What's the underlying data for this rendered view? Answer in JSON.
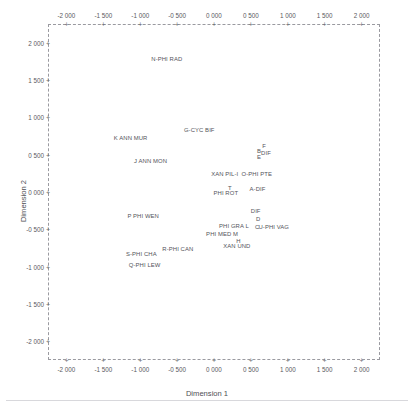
{
  "chart_data": {
    "type": "scatter",
    "title": "",
    "xlabel": "Dimension 1",
    "ylabel": "Dimension 2",
    "xlim": [
      -2.25,
      2.25
    ],
    "ylim": [
      -2.25,
      2.25
    ],
    "grid": false,
    "legend": null,
    "axis_style": "dashed-box-with-plus-ticks",
    "decimal_separator": "space",
    "xticks": [
      -2.0,
      -1.5,
      -1.0,
      -0.5,
      0.0,
      0.5,
      1.0,
      1.5,
      2.0
    ],
    "xticklabels": [
      "-2 000",
      "-1 500",
      "-1 000",
      "-0 500",
      "0 000",
      "0 500",
      "1 000",
      "1 500",
      "2 000"
    ],
    "yticks": [
      2.0,
      1.5,
      1.0,
      0.5,
      0.0,
      -0.5,
      -1.0,
      -1.5,
      -2.0
    ],
    "yticklabels": [
      "2 000",
      "1 500",
      "1 000",
      "0 500",
      "0 000",
      "-0 500",
      "-1 000",
      "-1 500",
      "-2 000"
    ],
    "points": [
      {
        "label": "N-PHI RAD",
        "x": -0.64,
        "y": 1.78,
        "anchor": "center"
      },
      {
        "label": "G-CYC BIF",
        "x": -0.2,
        "y": 0.83,
        "anchor": "center"
      },
      {
        "label": "K  ANN MUR",
        "x": -1.13,
        "y": 0.72,
        "anchor": "center"
      },
      {
        "label": "F",
        "x": 0.68,
        "y": 0.62,
        "anchor": "center"
      },
      {
        "label": "B",
        "x": 0.61,
        "y": 0.545,
        "anchor": "center"
      },
      {
        "label": "DIF",
        "x": 0.705,
        "y": 0.52,
        "anchor": "center"
      },
      {
        "label": "E",
        "x": 0.61,
        "y": 0.47,
        "anchor": "center"
      },
      {
        "label": "J  ANN MON",
        "x": -0.86,
        "y": 0.415,
        "anchor": "center"
      },
      {
        "label": "XAN PIL-I",
        "x": 0.145,
        "y": 0.24,
        "anchor": "center"
      },
      {
        "label": "O-PHI PTE",
        "x": 0.58,
        "y": 0.24,
        "anchor": "center"
      },
      {
        "label": "T",
        "x": 0.215,
        "y": 0.06,
        "anchor": "center"
      },
      {
        "label": "A-DIF",
        "x": 0.59,
        "y": 0.04,
        "anchor": "center"
      },
      {
        "label": "PHI ROT",
        "x": 0.16,
        "y": -0.01,
        "anchor": "center"
      },
      {
        "label": "DIF",
        "x": 0.565,
        "y": -0.26,
        "anchor": "center"
      },
      {
        "label": "P  PHI WEN",
        "x": -0.96,
        "y": -0.32,
        "anchor": "center"
      },
      {
        "label": "D",
        "x": 0.6,
        "y": -0.365,
        "anchor": "center"
      },
      {
        "label": "PHI GRA  L",
        "x": 0.27,
        "y": -0.455,
        "anchor": "center"
      },
      {
        "label": "C",
        "x": 0.585,
        "y": -0.47,
        "anchor": "center"
      },
      {
        "label": "U-PHI VAG",
        "x": 0.81,
        "y": -0.47,
        "anchor": "center"
      },
      {
        "label": "PHI MED  M",
        "x": 0.11,
        "y": -0.56,
        "anchor": "center"
      },
      {
        "label": "H",
        "x": 0.33,
        "y": -0.65,
        "anchor": "center"
      },
      {
        "label": "XAN UND",
        "x": 0.31,
        "y": -0.72,
        "anchor": "center"
      },
      {
        "label": "R-PHI CAN",
        "x": -0.49,
        "y": -0.76,
        "anchor": "center"
      },
      {
        "label": "S-PHI CHA",
        "x": -0.985,
        "y": -0.83,
        "anchor": "center"
      },
      {
        "label": "Q-PHI LEW",
        "x": -0.94,
        "y": -0.975,
        "anchor": "center"
      }
    ]
  },
  "axes": {
    "x_title": "Dimension 1",
    "y_title": "Dimension 2"
  }
}
